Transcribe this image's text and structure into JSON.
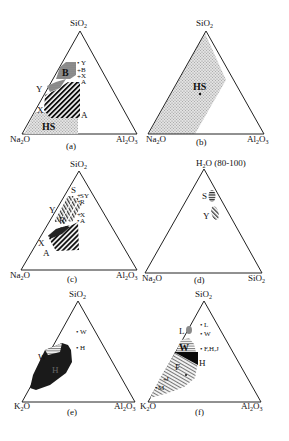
{
  "figure": {
    "panels": [
      {
        "id": "a",
        "caption": "(a)",
        "apex_label": "SiO2",
        "left_label": "Na2O",
        "right_label": "Al2O3",
        "regions": [
          {
            "label": "B",
            "fill": "dark-gray stipple"
          },
          {
            "label": "A",
            "fill": "diagonal hatch"
          },
          {
            "label": "HS",
            "fill": "light stipple"
          },
          {
            "label": "Y",
            "fill": "gray stipple"
          },
          {
            "label": "X",
            "fill": "dark hatch"
          }
        ],
        "points": [
          "Y",
          "B",
          "X",
          "A"
        ]
      },
      {
        "id": "b",
        "caption": "(b)",
        "apex_label": "SiO2",
        "left_label": "Na2O",
        "right_label": "Al2O3",
        "regions": [
          {
            "label": "HS",
            "fill": "light stipple"
          }
        ],
        "points": [
          "HS"
        ]
      },
      {
        "id": "c",
        "caption": "(c)",
        "apex_label": "SiO2",
        "left_label": "Na2O",
        "right_label": "Al2O3",
        "regions": [
          {
            "label": "S",
            "fill": "horizontal hatch"
          },
          {
            "label": "Y",
            "fill": "hatch"
          },
          {
            "label": "R",
            "fill": "hatch"
          },
          {
            "label": "X",
            "fill": "dark"
          },
          {
            "label": "A",
            "fill": "diagonal hatch"
          }
        ],
        "points": [
          "SY",
          "R",
          "X",
          "A"
        ]
      },
      {
        "id": "d",
        "caption": "(d)",
        "apex_label": "H2O (80-100)",
        "left_label": "Na2O",
        "right_label": "SiO2",
        "regions": [
          {
            "label": "S",
            "fill": "horizontal hatch"
          },
          {
            "label": "Y",
            "fill": "diagonal hatch"
          }
        ],
        "points": []
      },
      {
        "id": "e",
        "caption": "(e)",
        "apex_label": "SiO2",
        "left_label": "K2O",
        "right_label": "Al2O3",
        "regions": [
          {
            "label": "W",
            "fill": "light hatch"
          },
          {
            "label": "H",
            "fill": "solid dark"
          }
        ],
        "points": [
          "W",
          "H"
        ]
      },
      {
        "id": "f",
        "caption": "(f)",
        "apex_label": "SiO2",
        "left_label": "K2O",
        "right_label": "Al2O3",
        "regions": [
          {
            "label": "L",
            "fill": "gray"
          },
          {
            "label": "W",
            "fill": "horizontal hatch"
          },
          {
            "label": "H",
            "fill": "solid black"
          },
          {
            "label": "F",
            "fill": "diagonal hatch"
          },
          {
            "label": "J",
            "fill": "hatch"
          },
          {
            "label": "M",
            "fill": "hatch"
          }
        ],
        "points": [
          "L",
          "W",
          "F,H,J",
          "J",
          "M"
        ]
      }
    ]
  },
  "labels": {
    "a": {
      "apex": "SiO",
      "apex_sub": "2",
      "left": "Na",
      "left_sub": "2",
      "left_tail": "O",
      "right": "Al",
      "right_sub": "2",
      "right_tail": "O",
      "right_sub2": "3",
      "caption": "(a)",
      "B": "B",
      "A": "A",
      "HS": "HS",
      "Y": "Y",
      "X": "X",
      "pt_Y": "Y",
      "pt_B": "B",
      "pt_X": "X",
      "pt_A": "A"
    },
    "b": {
      "apex": "SiO",
      "apex_sub": "2",
      "left": "Na",
      "left_sub": "2",
      "left_tail": "O",
      "right": "Al",
      "right_sub": "2",
      "right_tail": "O",
      "right_sub2": "3",
      "caption": "(b)",
      "HS": "HS"
    },
    "c": {
      "apex": "SiO",
      "apex_sub": "2",
      "left": "Na",
      "left_sub": "2",
      "left_tail": "O",
      "right": "Al",
      "right_sub": "2",
      "right_tail": "O",
      "right_sub2": "3",
      "caption": "(c)",
      "S": "S",
      "Y": "Y",
      "R": "R",
      "X": "X",
      "A": "A",
      "pt_SY": "SY",
      "pt_R": "R",
      "pt_X": "X",
      "pt_A": "A"
    },
    "d": {
      "apex": "H",
      "apex_sub": "2",
      "apex_tail": "O (80-100)",
      "left": "Na",
      "left_sub": "2",
      "left_tail": "O",
      "right": "SiO",
      "right_sub": "2",
      "caption": "(d)",
      "S": "S",
      "Y": "Y"
    },
    "e": {
      "apex": "SiO",
      "apex_sub": "2",
      "left": "K",
      "left_sub": "2",
      "left_tail": "O",
      "right": "Al",
      "right_sub": "2",
      "right_tail": "O",
      "right_sub2": "3",
      "caption": "(e)",
      "W": "W",
      "H": "H",
      "pt_W": "W",
      "pt_H": "H"
    },
    "f": {
      "apex": "SiO",
      "apex_sub": "2",
      "left": "K",
      "left_sub": "2",
      "left_tail": "O",
      "right": "Al",
      "right_sub": "2",
      "right_tail": "O",
      "right_sub2": "3",
      "caption": "(f)",
      "L": "L",
      "W": "W",
      "H": "H",
      "F": "F",
      "pt_L": "L",
      "pt_W": "W",
      "pt_FHJ": "F,H,J",
      "pt_J": "J",
      "pt_M": "M"
    }
  },
  "colors": {
    "line": "#222222",
    "stipple_light": "#cfcfcf",
    "stipple_mid": "#a8a8a8",
    "stipple_dark": "#7a7a7a",
    "solid": "#111111"
  }
}
